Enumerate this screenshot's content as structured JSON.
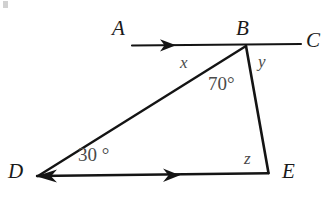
{
  "figure": {
    "background_color": "#ffffff",
    "stroke_color": "#141414",
    "label_color": "#1a1a1a",
    "annotation_color": "#4a4a4a"
  },
  "vertices": {
    "A": {
      "label": "A",
      "x": 112,
      "y": 31
    },
    "B": {
      "label": "B",
      "x": 236,
      "y": 18
    },
    "C": {
      "label": "C",
      "x": 306,
      "y": 30
    },
    "D": {
      "label": "D",
      "x": 8,
      "y": 161
    },
    "E": {
      "label": "E",
      "x": 282,
      "y": 161
    }
  },
  "points": {
    "B_point": {
      "x": 246,
      "y": 46
    },
    "D_point": {
      "x": 37,
      "y": 176
    },
    "E_point": {
      "x": 268,
      "y": 172
    },
    "A_line_start": {
      "x": 132,
      "y": 45
    },
    "C_line_end": {
      "x": 301,
      "y": 44
    }
  },
  "segment_labels": {
    "x": {
      "label": "x",
      "x": 180,
      "y": 54
    },
    "y": {
      "label": "y",
      "x": 258,
      "y": 53
    },
    "z": {
      "label": "z",
      "x": 244,
      "y": 150
    }
  },
  "angle_labels": {
    "at_B": {
      "label": "70°",
      "x": 208,
      "y": 74
    },
    "at_D": {
      "label": "30 °",
      "x": 78,
      "y": 145
    }
  },
  "arrow_marks": {
    "on_AB": {
      "description": "rightward arrowhead on ray AB",
      "tip_x": 174,
      "tip_y": 45
    },
    "on_DE": {
      "description": "rightward arrowhead on segment DE",
      "tip_x": 178,
      "tip_y": 175
    },
    "at_D": {
      "description": "leftward arrowhead at vertex D",
      "tip_x": 37,
      "tip_y": 176
    }
  }
}
